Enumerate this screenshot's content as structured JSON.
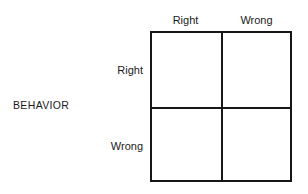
{
  "diagram": {
    "axis_label": "BEHAVIOR",
    "column_headers": [
      "Right",
      "Wrong"
    ],
    "row_labels": [
      "Right",
      "Wrong"
    ],
    "cells": [
      {
        "row": "Right",
        "column": "Right",
        "text": ""
      },
      {
        "row": "Right",
        "column": "Wrong",
        "text": ""
      },
      {
        "row": "Wrong",
        "column": "Right",
        "text": ""
      },
      {
        "row": "Wrong",
        "column": "Wrong",
        "text": ""
      }
    ],
    "colors": {
      "background": "#ffffff",
      "line": "#161616",
      "text": "#1a1a1a"
    }
  }
}
